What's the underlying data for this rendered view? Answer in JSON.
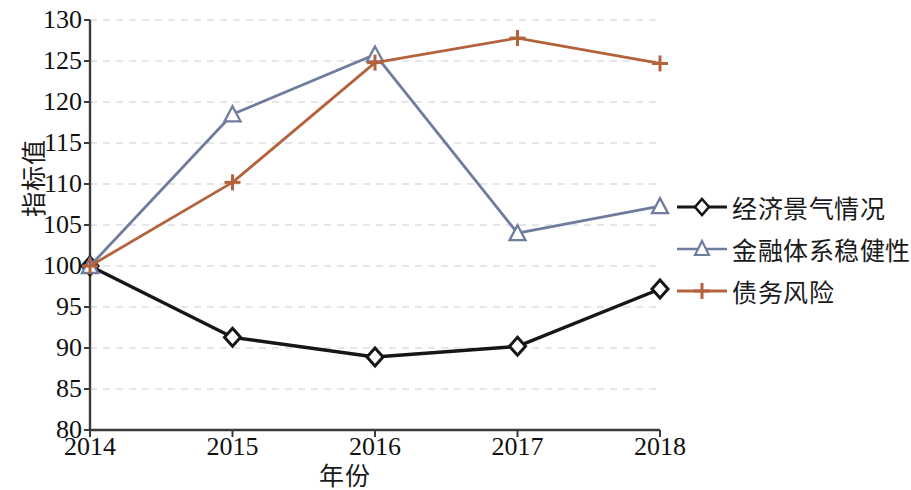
{
  "chart_data": {
    "type": "line",
    "title": "",
    "xlabel": "年份",
    "ylabel": "指标值",
    "categories": [
      "2014",
      "2015",
      "2016",
      "2017",
      "2018"
    ],
    "x": [
      2014,
      2015,
      2016,
      2017,
      2018
    ],
    "ylim": [
      80,
      130
    ],
    "ytick_step": 5,
    "yticks": [
      130,
      125,
      120,
      115,
      110,
      105,
      100,
      95,
      90,
      85,
      80
    ],
    "grid": "horizontal-dashed",
    "legend_position": "right",
    "series": [
      {
        "name": "经济景气情况",
        "values": [
          100,
          91.3,
          88.9,
          90.2,
          97.2
        ],
        "color": "#161616",
        "marker": "diamond"
      },
      {
        "name": "金融体系稳健性",
        "values": [
          100,
          118.5,
          125.8,
          104.0,
          107.3
        ],
        "color": "#6f7c9e",
        "marker": "triangle"
      },
      {
        "name": "债务风险",
        "values": [
          100,
          110.2,
          124.8,
          127.8,
          124.7
        ],
        "color": "#b4623b",
        "marker": "plus"
      }
    ]
  },
  "legend": {
    "items": [
      {
        "label": "经济景气情况"
      },
      {
        "label": "金融体系稳健性"
      },
      {
        "label": "债务风险"
      }
    ]
  },
  "axes": {
    "y_title": "指标值",
    "x_title": "年份",
    "y_tick_labels": [
      "130",
      "125",
      "120",
      "115",
      "110",
      "105",
      "100",
      "95",
      "90",
      "85",
      "80"
    ],
    "x_tick_labels": [
      "2014",
      "2015",
      "2016",
      "2017",
      "2018"
    ]
  },
  "colors": {
    "series_1": "#161616",
    "series_2": "#6f7c9e",
    "series_3": "#b4623b",
    "axis": "#3a3a3a",
    "grid": "#c9cdd6",
    "background": "#ffffff"
  }
}
